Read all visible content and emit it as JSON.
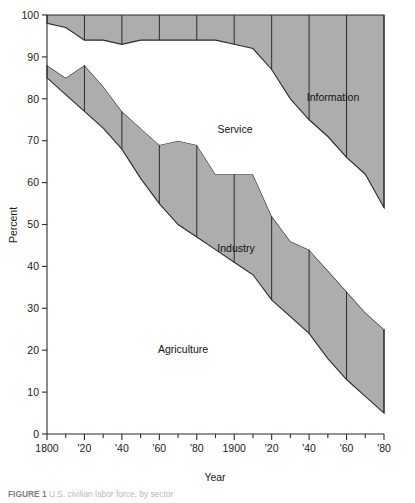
{
  "figure": {
    "caption_label": "FIGURE 1",
    "caption_text": "U.S. civilian labor force, by sector"
  },
  "axes": {
    "x_title": "Year",
    "y_title": "Percent",
    "x_tick_labels": [
      "1800",
      "'20",
      "'40",
      "'60",
      "'80",
      "1900",
      "'20",
      "'40",
      "'60",
      "'80"
    ],
    "y_tick_labels": [
      "0",
      "10",
      "20",
      "30",
      "40",
      "50",
      "60",
      "70",
      "80",
      "90",
      "100"
    ]
  },
  "band_labels": {
    "agriculture": "Agriculture",
    "industry": "Industry",
    "service": "Service",
    "information": "Information"
  },
  "colors": {
    "band_gray": "#adadad",
    "band_white": "#ffffff",
    "line": "#2b2b2b"
  },
  "chart_data": {
    "type": "area",
    "title": "U.S. civilian labor force, by sector",
    "xlabel": "Year",
    "ylabel": "Percent",
    "xlim": [
      1800,
      1980
    ],
    "ylim": [
      0,
      100
    ],
    "grid": false,
    "legend_position": "inline-band-labels",
    "stacked": true,
    "stack_order_bottom_to_top": [
      "Agriculture",
      "Industry",
      "Service",
      "Information"
    ],
    "x": [
      1800,
      1810,
      1820,
      1830,
      1840,
      1850,
      1860,
      1870,
      1880,
      1890,
      1900,
      1910,
      1920,
      1930,
      1940,
      1950,
      1960,
      1970,
      1980
    ],
    "series": [
      {
        "name": "Agriculture",
        "fill": "white",
        "values": [
          85,
          81,
          77,
          73,
          68,
          61,
          55,
          50,
          47,
          44,
          41,
          38,
          32,
          28,
          24,
          18,
          13,
          9,
          5
        ]
      },
      {
        "name": "Industry",
        "fill": "gray",
        "values": [
          3,
          4,
          11,
          10,
          9,
          12,
          14,
          20,
          22,
          18,
          21,
          24,
          20,
          18,
          20,
          21,
          21,
          20,
          20
        ]
      },
      {
        "name": "Service",
        "fill": "white",
        "values": [
          10,
          12,
          6,
          11,
          16,
          21,
          25,
          24,
          25,
          32,
          31,
          30,
          35,
          34,
          31,
          32,
          32,
          33,
          29
        ]
      },
      {
        "name": "Information",
        "fill": "gray",
        "values": [
          2,
          3,
          6,
          6,
          7,
          6,
          6,
          6,
          6,
          6,
          7,
          8,
          13,
          20,
          25,
          29,
          34,
          38,
          46
        ]
      }
    ],
    "boundaries_cumulative": {
      "agriculture_top": [
        85,
        81,
        77,
        73,
        68,
        61,
        55,
        50,
        47,
        44,
        41,
        38,
        32,
        28,
        24,
        18,
        13,
        9,
        5
      ],
      "industry_top": [
        88,
        85,
        88,
        83,
        77,
        73,
        69,
        70,
        69,
        62,
        62,
        62,
        52,
        46,
        44,
        39,
        34,
        29,
        25
      ],
      "service_top": [
        98,
        97,
        94,
        94,
        93,
        94,
        94,
        94,
        94,
        94,
        93,
        92,
        87,
        80,
        75,
        71,
        66,
        62,
        54
      ],
      "information_top": [
        100,
        100,
        100,
        100,
        100,
        100,
        100,
        100,
        100,
        100,
        100,
        100,
        100,
        100,
        100,
        100,
        100,
        100,
        100
      ]
    }
  }
}
